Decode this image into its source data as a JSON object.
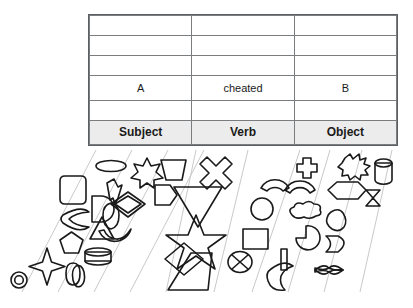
{
  "figure": {
    "background_color": "#ffffff",
    "stroke_color": "#1a1a1a",
    "lane_line_color": "#c9c9c9",
    "table": {
      "border_color": "#5d6063",
      "grid_color": "#7a7d80",
      "header_background": "#ececec",
      "columns": [
        "Subject",
        "Verb",
        "Object"
      ],
      "rows": [
        {
          "type": "empty",
          "cells": [
            "",
            "",
            ""
          ]
        },
        {
          "type": "empty",
          "cells": [
            "",
            "",
            ""
          ]
        },
        {
          "type": "empty",
          "cells": [
            "",
            "",
            ""
          ]
        },
        {
          "type": "filled",
          "cells": [
            "A",
            "cheated",
            "B"
          ]
        },
        {
          "type": "empty",
          "cells": [
            "",
            "",
            ""
          ]
        },
        {
          "type": "header",
          "cells": [
            "Subject",
            "Verb",
            "Object"
          ]
        }
      ]
    },
    "lanes": [
      {
        "id": "lane-1",
        "column": "Subject",
        "shapes": [
          "circle-ring-icon",
          "four-point-star-icon"
        ]
      },
      {
        "id": "lane-2",
        "column": "Subject",
        "shapes": [
          "rounded-square-icon",
          "crescent-icon",
          "pentagon-icon",
          "vertical-capsule-icon"
        ]
      },
      {
        "id": "lane-3",
        "column": "Subject",
        "shapes": [
          "ellipse-icon",
          "semicircle-icon",
          "triangle-icon",
          "cylinder-band-icon",
          "vertical-oval-icon"
        ]
      },
      {
        "id": "lane-4",
        "column": "Subject",
        "shapes": [
          "six-point-star-icon",
          "lightning-bolt-icon",
          "diamond-in-diamond-icon",
          "rounded-rect-icon",
          "smile-arc-icon"
        ]
      },
      {
        "id": "lane-5",
        "column": "Verb",
        "shapes": [
          "trapezoid-up-icon",
          "hexagon-diamond-icon"
        ]
      },
      {
        "id": "lane-6",
        "column": "Verb",
        "shapes": [
          "four-point-cross-icon",
          "triangle-down-icon",
          "five-point-star-icon",
          "small-diamond-icon",
          "trapezoid-down-icon"
        ]
      },
      {
        "id": "lane-7",
        "column": "Object",
        "shapes": [
          "arch-icon",
          "circle-icon",
          "square-icon",
          "crossed-circle-icon"
        ]
      },
      {
        "id": "lane-8",
        "column": "Object",
        "shapes": [
          "plus-cross-icon",
          "arc-bridge-icon",
          "cloud-icon",
          "pacman-icon",
          "vertical-bar-icon",
          "moon-icon"
        ]
      },
      {
        "id": "lane-9",
        "column": "Object",
        "shapes": [
          "starburst-icon",
          "hexagon-icon",
          "blob-icon",
          "chevron-icon",
          "bowtie-icon"
        ]
      },
      {
        "id": "lane-10",
        "column": "Object",
        "shapes": [
          "cylinder-icon",
          "hourglass-icon"
        ]
      }
    ]
  }
}
